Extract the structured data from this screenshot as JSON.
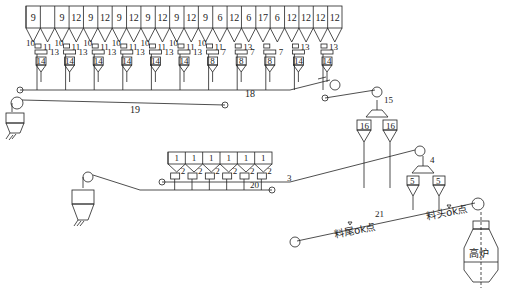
{
  "diagram": {
    "type": "blast-furnace-charging-flow",
    "top_bins": [
      "9",
      "",
      "9",
      "12",
      "9",
      "12",
      "9",
      "12",
      "9",
      "12",
      "9",
      "12",
      "9",
      "6",
      "12",
      "6",
      "17",
      "6",
      "12",
      "12",
      "12",
      "12"
    ],
    "top_modules": [
      {
        "left": "10",
        "right": "11",
        "mid": "13",
        "hopper": "14"
      },
      {
        "left": "10",
        "right": "11",
        "mid": "13",
        "hopper": "14"
      },
      {
        "left": "10",
        "right": "11",
        "mid": "13",
        "hopper": "14"
      },
      {
        "left": "10",
        "right": "11",
        "mid": "13",
        "hopper": "14"
      },
      {
        "left": "10",
        "right": "11",
        "mid": "13",
        "hopper": "14"
      },
      {
        "left": "10",
        "right": "11",
        "mid": "13",
        "hopper": "14"
      },
      {
        "left": "10",
        "right": "11",
        "mid": "7",
        "hopper": "8"
      },
      {
        "left": "",
        "right": "13",
        "mid": "7",
        "hopper": "8"
      },
      {
        "left": "",
        "right": "",
        "mid": "7",
        "hopper": "8"
      },
      {
        "left": "",
        "right": "13",
        "mid": "",
        "hopper": "14"
      },
      {
        "left": "",
        "right": "13",
        "mid": "",
        "hopper": "14"
      }
    ],
    "conveyor_labels": {
      "c18": "18",
      "c19": "19",
      "c3": "3",
      "c20": "20",
      "c21": "21",
      "c15": "15",
      "c4": "4"
    },
    "lower_bins": [
      "1",
      "1",
      "1",
      "1",
      "1",
      "1"
    ],
    "lower_feeder_label": "2",
    "hopper_16": [
      "16",
      "16"
    ],
    "hopper_5": [
      "5",
      "5"
    ],
    "tail_point": "料尾ok点",
    "head_point": "料头ok点",
    "furnace": "高炉"
  }
}
